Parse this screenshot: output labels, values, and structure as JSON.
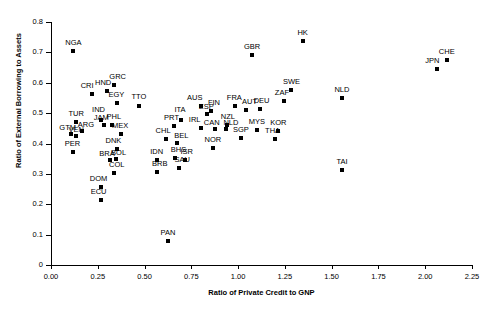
{
  "chart_data": {
    "type": "scatter",
    "title": "",
    "xlabel": "Ratio of Private Credit to GNP",
    "ylabel": "Ratio of External Borrowing to Assets",
    "xlim": [
      0.0,
      2.25
    ],
    "ylim": [
      0.0,
      0.8
    ],
    "xticks": [
      "0.00",
      "0.25",
      "0.50",
      "0.75",
      "1.00",
      "1.25",
      "1.50",
      "1.75",
      "2.00",
      "2.25"
    ],
    "xtick_values": [
      0.0,
      0.25,
      0.5,
      0.75,
      1.0,
      1.25,
      1.5,
      1.75,
      2.0,
      2.25
    ],
    "yticks": [
      "0",
      "0.1",
      "0.2",
      "0.3",
      "0.4",
      "0.5",
      "0.6",
      "0.7",
      "0.8"
    ],
    "ytick_values": [
      0,
      0.1,
      0.2,
      0.3,
      0.4,
      0.5,
      0.6,
      0.7,
      0.8
    ],
    "grid": false,
    "legend": "none",
    "marker": "square",
    "marker_color": "#000000",
    "points": [
      {
        "label": "NGA",
        "x": 0.12,
        "y": 0.705,
        "lx": 0,
        "ly": -4
      },
      {
        "label": "CRI",
        "x": 0.22,
        "y": 0.564,
        "lx": -5,
        "ly": -4
      },
      {
        "label": "HND",
        "x": 0.3,
        "y": 0.572,
        "lx": -4,
        "ly": -4
      },
      {
        "label": "GRC",
        "x": 0.335,
        "y": 0.592,
        "lx": 4,
        "ly": -4
      },
      {
        "label": "EGY",
        "x": 0.355,
        "y": 0.534,
        "lx": -1,
        "ly": -4
      },
      {
        "label": "TTO",
        "x": 0.47,
        "y": 0.524,
        "lx": 0,
        "ly": -5
      },
      {
        "label": "ITA",
        "x": 0.695,
        "y": 0.479,
        "lx": -1,
        "ly": -6
      },
      {
        "label": "TUR",
        "x": 0.135,
        "y": 0.472,
        "lx": 0,
        "ly": -4
      },
      {
        "label": "IND",
        "x": 0.265,
        "y": 0.478,
        "lx": -2,
        "ly": -6
      },
      {
        "label": "PHL",
        "x": 0.325,
        "y": 0.462,
        "lx": 2,
        "ly": -4
      },
      {
        "label": "JAM",
        "x": 0.285,
        "y": 0.462,
        "lx": -3,
        "ly": -3
      },
      {
        "label": "GTM",
        "x": 0.105,
        "y": 0.432,
        "lx": -3,
        "ly": -2
      },
      {
        "label": "VEN",
        "x": 0.135,
        "y": 0.424,
        "lx": 0,
        "ly": -2
      },
      {
        "label": "ARG",
        "x": 0.165,
        "y": 0.441,
        "lx": 4,
        "ly": -2
      },
      {
        "label": "MEX",
        "x": 0.375,
        "y": 0.432,
        "lx": -1,
        "ly": -4
      },
      {
        "label": "PRT",
        "x": 0.655,
        "y": 0.458,
        "lx": -2,
        "ly": -4
      },
      {
        "label": "AUS",
        "x": 0.8,
        "y": 0.524,
        "lx": -6,
        "ly": -4
      },
      {
        "label": "FIN",
        "x": 0.855,
        "y": 0.506,
        "lx": 3,
        "ly": -4
      },
      {
        "label": "ESP",
        "x": 0.835,
        "y": 0.498,
        "lx": -1,
        "ly": -3
      },
      {
        "label": "FRA",
        "x": 0.985,
        "y": 0.522,
        "lx": -1,
        "ly": -4
      },
      {
        "label": "AUT",
        "x": 1.04,
        "y": 0.509,
        "lx": 4,
        "ly": -4
      },
      {
        "label": "DEU",
        "x": 1.115,
        "y": 0.512,
        "lx": 2,
        "ly": -4
      },
      {
        "label": "IRL",
        "x": 0.8,
        "y": 0.452,
        "lx": -6,
        "ly": -4
      },
      {
        "label": "NZL",
        "x": 0.94,
        "y": 0.462,
        "lx": 1,
        "ly": -4
      },
      {
        "label": "CAN",
        "x": 0.875,
        "y": 0.447,
        "lx": -3,
        "ly": -2
      },
      {
        "label": "NLD2",
        "x": 0.935,
        "y": 0.448,
        "lx": 5,
        "ly": -2
      },
      {
        "label": "SGP",
        "x": 1.015,
        "y": 0.418,
        "lx": 0,
        "ly": -4
      },
      {
        "label": "MYS",
        "x": 1.1,
        "y": 0.445,
        "lx": 0,
        "ly": -4
      },
      {
        "label": "KOR",
        "x": 1.215,
        "y": 0.441,
        "lx": 0,
        "ly": -4
      },
      {
        "label": "THA",
        "x": 1.195,
        "y": 0.414,
        "lx": -2,
        "ly": -4
      },
      {
        "label": "CHL",
        "x": 0.615,
        "y": 0.416,
        "lx": -3,
        "ly": -4
      },
      {
        "label": "BEL",
        "x": 0.675,
        "y": 0.402,
        "lx": 4,
        "ly": -3
      },
      {
        "label": "NOR",
        "x": 0.865,
        "y": 0.386,
        "lx": 0,
        "ly": -4
      },
      {
        "label": "SWE",
        "x": 1.285,
        "y": 0.575,
        "lx": 0,
        "ly": -4
      },
      {
        "label": "ZAF",
        "x": 1.245,
        "y": 0.541,
        "lx": -2,
        "ly": -4
      },
      {
        "label": "GBR",
        "x": 1.075,
        "y": 0.692,
        "lx": 0,
        "ly": -4
      },
      {
        "label": "HK",
        "x": 1.345,
        "y": 0.736,
        "lx": 0,
        "ly": -4
      },
      {
        "label": "NLD",
        "x": 1.555,
        "y": 0.551,
        "lx": 0,
        "ly": -4
      },
      {
        "label": "CHE",
        "x": 2.115,
        "y": 0.676,
        "lx": 0,
        "ly": -4
      },
      {
        "label": "JPN",
        "x": 2.065,
        "y": 0.645,
        "lx": -5,
        "ly": -4
      },
      {
        "label": "TAI",
        "x": 1.555,
        "y": 0.312,
        "lx": 0,
        "ly": -4
      },
      {
        "label": "PER",
        "x": 0.115,
        "y": 0.372,
        "lx": 0,
        "ly": -4
      },
      {
        "label": "DNK",
        "x": 0.355,
        "y": 0.382,
        "lx": -4,
        "ly": -4
      },
      {
        "label": "BRA",
        "x": 0.315,
        "y": 0.345,
        "lx": -3,
        "ly": -2
      },
      {
        "label": "BOL",
        "x": 0.345,
        "y": 0.348,
        "lx": 3,
        "ly": -2
      },
      {
        "label": "IDN",
        "x": 0.565,
        "y": 0.345,
        "lx": 0,
        "ly": -4
      },
      {
        "label": "BHS",
        "x": 0.665,
        "y": 0.352,
        "lx": 3,
        "ly": -4
      },
      {
        "label": "ISR",
        "x": 0.715,
        "y": 0.347,
        "lx": 2,
        "ly": -4
      },
      {
        "label": "COL",
        "x": 0.335,
        "y": 0.302,
        "lx": 3,
        "ly": -4
      },
      {
        "label": "BRB",
        "x": 0.565,
        "y": 0.305,
        "lx": 3,
        "ly": -4
      },
      {
        "label": "SAU",
        "x": 0.685,
        "y": 0.318,
        "lx": 3,
        "ly": -4
      },
      {
        "label": "DOM",
        "x": 0.265,
        "y": 0.258,
        "lx": -2,
        "ly": -4
      },
      {
        "label": "ECU",
        "x": 0.265,
        "y": 0.214,
        "lx": -2,
        "ly": -4
      },
      {
        "label": "PAN",
        "x": 0.625,
        "y": 0.079,
        "lx": 0,
        "ly": -4
      }
    ]
  }
}
